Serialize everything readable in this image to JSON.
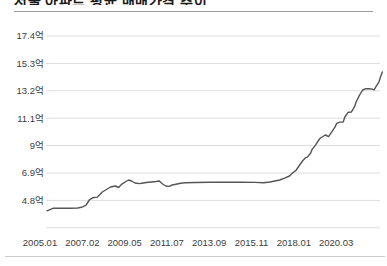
{
  "page": {
    "title": "서울 아파트 평균 매매가격 추이",
    "title_clipped": true
  },
  "chart_data": {
    "type": "line",
    "title": "서울 아파트 평균 매매가격 추이",
    "unit": "억",
    "y_ticks": [
      "17.4억",
      "15.3억",
      "13.2억",
      "11.1억",
      "9억",
      "6.9억",
      "4.8억"
    ],
    "y_tick_values": [
      17.4,
      15.3,
      13.2,
      11.1,
      9.0,
      6.9,
      4.8
    ],
    "x_ticks": [
      "2005.01",
      "2007.02",
      "2009.05",
      "2011.07",
      "2013.09",
      "2015.11",
      "2018.01",
      "2020.03"
    ],
    "ylim": [
      2.7,
      17.4
    ],
    "grid": true,
    "legend": "none",
    "line_color": "#555555",
    "grid_color": "#dddddd",
    "label_color": "#3c3c3c",
    "series": [
      {
        "name": "매매가격",
        "points": [
          [
            "2005.01",
            4.0
          ],
          [
            "2005.05",
            4.2
          ],
          [
            "2005.09",
            4.2
          ],
          [
            "2006.03",
            4.2
          ],
          [
            "2006.08",
            4.22
          ],
          [
            "2006.11",
            4.3
          ],
          [
            "2007.01",
            4.45
          ],
          [
            "2007.03",
            4.83
          ],
          [
            "2007.05",
            5.0
          ],
          [
            "2007.08",
            5.05
          ],
          [
            "2007.11",
            5.44
          ],
          [
            "2008.01",
            5.6
          ],
          [
            "2008.04",
            5.83
          ],
          [
            "2008.07",
            5.9
          ],
          [
            "2008.09",
            5.79
          ],
          [
            "2008.11",
            6.05
          ],
          [
            "2009.01",
            6.21
          ],
          [
            "2009.03",
            6.36
          ],
          [
            "2009.05",
            6.29
          ],
          [
            "2009.07",
            6.13
          ],
          [
            "2009.10",
            6.09
          ],
          [
            "2009.12",
            6.13
          ],
          [
            "2010.02",
            6.17
          ],
          [
            "2010.05",
            6.21
          ],
          [
            "2010.08",
            6.25
          ],
          [
            "2010.10",
            6.29
          ],
          [
            "2010.12",
            6.06
          ],
          [
            "2011.02",
            5.9
          ],
          [
            "2011.04",
            5.87
          ],
          [
            "2011.06",
            5.98
          ],
          [
            "2011.09",
            6.06
          ],
          [
            "2011.11",
            6.11
          ],
          [
            "2012.02",
            6.15
          ],
          [
            "2012.08",
            6.17
          ],
          [
            "2013.05",
            6.19
          ],
          [
            "2014.02",
            6.19
          ],
          [
            "2014.12",
            6.19
          ],
          [
            "2015.09",
            6.18
          ],
          [
            "2016.02",
            6.15
          ],
          [
            "2016.06",
            6.21
          ],
          [
            "2016.12",
            6.36
          ],
          [
            "2017.03",
            6.5
          ],
          [
            "2017.06",
            6.67
          ],
          [
            "2017.08",
            6.92
          ],
          [
            "2017.10",
            7.1
          ],
          [
            "2017.11",
            7.28
          ],
          [
            "2018.02",
            7.82
          ],
          [
            "2018.04",
            8.08
          ],
          [
            "2018.05",
            8.12
          ],
          [
            "2018.07",
            8.43
          ],
          [
            "2018.08",
            8.73
          ],
          [
            "2018.10",
            9.04
          ],
          [
            "2018.12",
            9.43
          ],
          [
            "2019.01",
            9.58
          ],
          [
            "2019.04",
            9.81
          ],
          [
            "2019.06",
            9.69
          ],
          [
            "2019.08",
            10.06
          ],
          [
            "2019.10",
            10.43
          ],
          [
            "2019.11",
            10.71
          ],
          [
            "2020.01",
            10.8
          ],
          [
            "2020.03",
            10.8
          ],
          [
            "2020.04",
            11.19
          ],
          [
            "2020.06",
            11.55
          ],
          [
            "2020.08",
            11.57
          ],
          [
            "2020.10",
            11.98
          ],
          [
            "2020.11",
            12.36
          ],
          [
            "2021.01",
            12.87
          ],
          [
            "2021.03",
            13.26
          ],
          [
            "2021.05",
            13.37
          ],
          [
            "2021.07",
            13.36
          ],
          [
            "2021.09",
            13.33
          ],
          [
            "2021.10",
            13.26
          ],
          [
            "2021.11",
            13.51
          ],
          [
            "2022.01",
            13.89
          ],
          [
            "2022.02",
            14.28
          ],
          [
            "2022.03",
            14.65
          ]
        ]
      }
    ]
  }
}
